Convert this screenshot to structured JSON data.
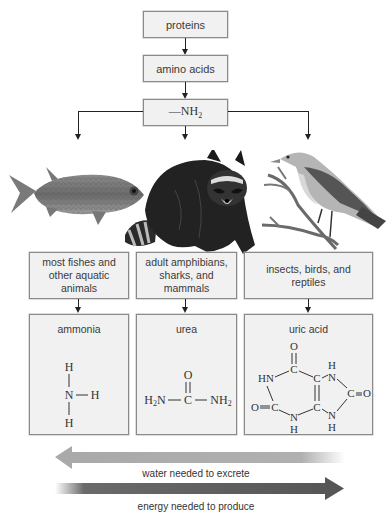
{
  "flow": {
    "step1": "proteins",
    "step2": "amino acids",
    "step3_prefix": "—NH",
    "step3_sub": "2"
  },
  "animals": [
    {
      "name": "fish",
      "icon": "fish-illustration"
    },
    {
      "name": "raccoon",
      "icon": "raccoon-illustration"
    },
    {
      "name": "bird",
      "icon": "bird-illustration"
    }
  ],
  "groups": [
    {
      "label": "most fishes and other aquatic animals",
      "lines": [
        "most fishes and",
        "other aquatic",
        "animals"
      ]
    },
    {
      "label": "adult amphibians, sharks, and mammals",
      "lines": [
        "adult amphibians,",
        "sharks, and",
        "mammals"
      ]
    },
    {
      "label": "insects, birds, and reptiles",
      "lines": [
        "insects, birds, and",
        "reptiles"
      ]
    }
  ],
  "compounds": [
    {
      "name": "ammonia",
      "formula_atoms": {
        "top": "H",
        "center": "N",
        "right": "H",
        "bottom": "H"
      }
    },
    {
      "name": "urea",
      "formula_atoms": {
        "top": "O",
        "left": "H2N",
        "center": "C",
        "right": "NH2"
      }
    },
    {
      "name": "uric acid",
      "formula_atoms": [
        "O",
        "C",
        "HN",
        "C",
        "N",
        "H",
        "C",
        "O",
        "O",
        "C",
        "N",
        "H",
        "C",
        "N",
        "H"
      ]
    }
  ],
  "gradients": [
    {
      "label": "water needed to excrete",
      "direction": "left",
      "color": "#a9a9a9"
    },
    {
      "label": "energy needed to produce",
      "direction": "right",
      "color": "#555555"
    }
  ]
}
